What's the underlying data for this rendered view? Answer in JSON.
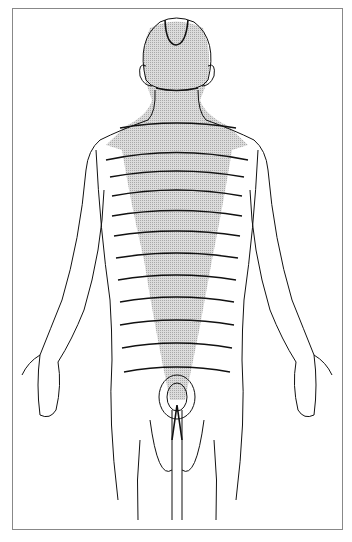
{
  "figure": {
    "type": "anatomical-illustration",
    "colors": {
      "line": "#111111",
      "shading": "#bdbdbd",
      "frame": "#888888",
      "background": "#ffffff"
    }
  }
}
